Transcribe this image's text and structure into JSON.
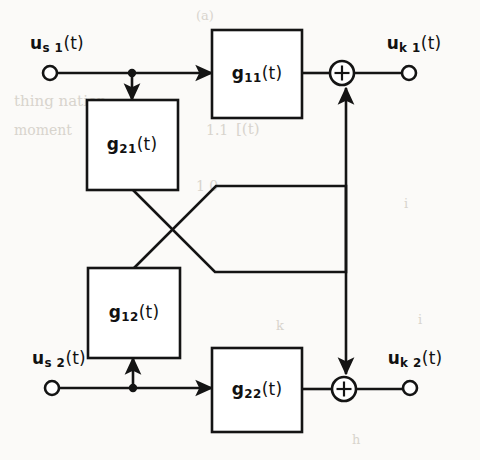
{
  "diagram": {
    "type": "block-diagram",
    "stroke_color": "#141414",
    "background_color": "#fbfaf8",
    "inputs": [
      {
        "id": "us1",
        "label_base": "u",
        "label_sub": "s 1",
        "label_arg": "(t)",
        "label_full": "u_s1(t)",
        "terminal_x": 50,
        "terminal_y": 73
      },
      {
        "id": "us2",
        "label_base": "u",
        "label_sub": "s 2",
        "label_arg": "(t)",
        "label_full": "u_s2(t)",
        "terminal_x": 52,
        "terminal_y": 388
      }
    ],
    "outputs": [
      {
        "id": "uk1",
        "label_base": "u",
        "label_sub": "k 1",
        "label_arg": "(t)",
        "label_full": "u_k1(t)",
        "terminal_x": 409,
        "terminal_y": 73
      },
      {
        "id": "uk2",
        "label_base": "u",
        "label_sub": "k 2",
        "label_arg": "(t)",
        "label_full": "u_k2(t)",
        "terminal_x": 410,
        "terminal_y": 388
      }
    ],
    "blocks": [
      {
        "id": "g11",
        "label_base": "g",
        "label_sub": "11",
        "label_arg": "(t)",
        "label_full": "g11(t)",
        "x": 212,
        "y": 30,
        "w": 90,
        "h": 88
      },
      {
        "id": "g21",
        "label_base": "g",
        "label_sub": "21",
        "label_arg": "(t)",
        "label_full": "g21(t)",
        "x": 87,
        "y": 100,
        "w": 91,
        "h": 90
      },
      {
        "id": "g12",
        "label_base": "g",
        "label_sub": "12",
        "label_arg": "(t)",
        "label_full": "g12(t)",
        "x": 88,
        "y": 268,
        "w": 92,
        "h": 90
      },
      {
        "id": "g22",
        "label_base": "g",
        "label_sub": "22",
        "label_arg": "(t)",
        "label_full": "g22(t)",
        "x": 212,
        "y": 348,
        "w": 90,
        "h": 84
      }
    ],
    "summing_junctions": [
      {
        "id": "sum1",
        "symbol": "+",
        "cx": 342,
        "cy": 73,
        "r": 12
      },
      {
        "id": "sum2",
        "symbol": "+",
        "cx": 344,
        "cy": 389,
        "r": 12
      }
    ],
    "junction_dots": [
      {
        "id": "dot-us1",
        "cx": 132,
        "cy": 73,
        "r": 4
      },
      {
        "id": "dot-us2",
        "cx": 133,
        "cy": 388,
        "r": 4
      }
    ]
  },
  "ghost_text": [
    {
      "text": "(a)",
      "x": 196,
      "y": 8,
      "size": 13,
      "rot": 0
    },
    {
      "text": "thing  nation",
      "x": 14,
      "y": 92,
      "size": 15,
      "rot": 0
    },
    {
      "text": "moment",
      "x": 14,
      "y": 122,
      "size": 14,
      "rot": 0
    },
    {
      "text": "einerge",
      "x": 92,
      "y": 126,
      "size": 14,
      "rot": 0
    },
    {
      "text": "1.1",
      "x": 206,
      "y": 122,
      "size": 14,
      "rot": 0
    },
    {
      "text": "[(t)",
      "x": 236,
      "y": 120,
      "size": 15,
      "rot": 0
    },
    {
      "text": "1 0",
      "x": 196,
      "y": 178,
      "size": 14,
      "rot": 0
    },
    {
      "text": "i",
      "x": 404,
      "y": 196,
      "size": 13,
      "rot": 0
    },
    {
      "text": "k",
      "x": 276,
      "y": 318,
      "size": 13,
      "rot": 0
    },
    {
      "text": "i",
      "x": 418,
      "y": 312,
      "size": 13,
      "rot": 0
    },
    {
      "text": "h",
      "x": 352,
      "y": 432,
      "size": 13,
      "rot": 0
    }
  ]
}
